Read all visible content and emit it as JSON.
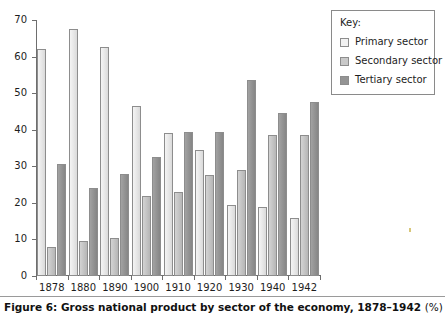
{
  "caption": {
    "text": "Figure 6: Gross national product by sector of the economy, 1878–1942",
    "unit": "(%)"
  },
  "legend": {
    "title": "Key:",
    "items": [
      {
        "label": "Primary sector",
        "color": "#f2f2f2"
      },
      {
        "label": "Secondary sector",
        "color": "#c9c9c9"
      },
      {
        "label": "Tertiary sector",
        "color": "#949494"
      }
    ]
  },
  "axes": {
    "y_ticks": [
      "0",
      "10",
      "20",
      "30",
      "40",
      "50",
      "60",
      "70"
    ],
    "x_ticks": [
      "1878",
      "1880",
      "1890",
      "1900",
      "1910",
      "1920",
      "1930",
      "1940",
      "1942"
    ]
  },
  "chart_data": {
    "type": "bar",
    "title": "Figure 6: Gross national product by sector of the economy, 1878–1942 (%)",
    "xlabel": "",
    "ylabel": "",
    "ylim": [
      0,
      70
    ],
    "ytick_step": 10,
    "grid": false,
    "legend_position": "top-right-outside",
    "categories": [
      "1878",
      "1880",
      "1890",
      "1900",
      "1910",
      "1920",
      "1930",
      "1940",
      "1942"
    ],
    "series": [
      {
        "name": "Primary sector",
        "color": "#f2f2f2",
        "values": [
          62,
          67.5,
          62.5,
          46.5,
          39,
          34.5,
          19.5,
          19,
          16
        ]
      },
      {
        "name": "Secondary sector",
        "color": "#c9c9c9",
        "values": [
          8,
          9.5,
          10.5,
          22,
          23,
          27.5,
          29,
          38.5,
          38.5
        ]
      },
      {
        "name": "Tertiary sector",
        "color": "#949494",
        "values": [
          30.5,
          24,
          28,
          32.5,
          39.5,
          39.5,
          53.5,
          44.5,
          47.5
        ]
      }
    ]
  }
}
